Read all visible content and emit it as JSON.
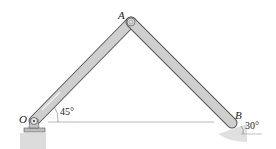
{
  "labels": {
    "O": "O",
    "A": "A",
    "B": "B"
  },
  "angles": {
    "at_O": "45°",
    "at_B": "30°"
  },
  "colors": {
    "link_fill": "#c9c9c9",
    "link_edge": "#555555",
    "ground": "#d9d9d9",
    "line": "#888888"
  }
}
